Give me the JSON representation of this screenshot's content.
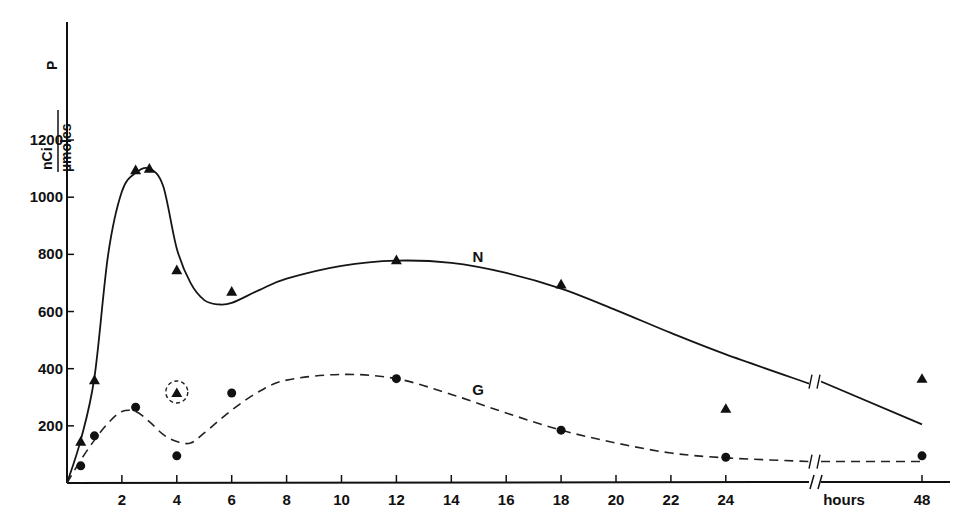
{
  "chart_data": {
    "type": "line",
    "title": "",
    "ylabel": {
      "numerator": "nCi",
      "denominator": "µmoles",
      "suffix": "P"
    },
    "xlabel": "hours",
    "ylim": [
      0,
      1200
    ],
    "xlim": [
      0,
      48
    ],
    "x_axis_break": {
      "between": [
        24,
        48
      ]
    },
    "yticks": [
      200,
      400,
      600,
      800,
      1000,
      1200
    ],
    "ytick_labels": [
      "200",
      "400",
      "600",
      "800",
      "1000",
      "1200"
    ],
    "xticks": [
      2,
      4,
      6,
      8,
      10,
      12,
      14,
      16,
      18,
      20,
      22,
      24,
      48
    ],
    "xtick_labels": [
      "2",
      "4",
      "6",
      "8",
      "10",
      "12",
      "14",
      "16",
      "18",
      "20",
      "22",
      "24",
      "48"
    ],
    "grid": false,
    "legend": "none (series labeled inline)",
    "series": [
      {
        "name": "N",
        "marker": "triangle",
        "line_style": "solid",
        "points": [
          {
            "x": 0.5,
            "y": 145
          },
          {
            "x": 1,
            "y": 360
          },
          {
            "x": 2.5,
            "y": 1095
          },
          {
            "x": 3,
            "y": 1100
          },
          {
            "x": 4,
            "y": 745
          },
          {
            "x": 6,
            "y": 670
          },
          {
            "x": 12,
            "y": 780
          },
          {
            "x": 18,
            "y": 695
          },
          {
            "x": 24,
            "y": 260
          },
          {
            "x": 48,
            "y": 365
          }
        ],
        "outliers_circled": [
          {
            "x": 4,
            "y": 315
          }
        ],
        "fitted_curve": [
          [
            0,
            0
          ],
          [
            0.5,
            150
          ],
          [
            1,
            370
          ],
          [
            1.5,
            800
          ],
          [
            2,
            1020
          ],
          [
            2.5,
            1085
          ],
          [
            3,
            1100
          ],
          [
            3.5,
            1040
          ],
          [
            4,
            820
          ],
          [
            4.5,
            700
          ],
          [
            5,
            640
          ],
          [
            5.5,
            625
          ],
          [
            6,
            630
          ],
          [
            7,
            675
          ],
          [
            8,
            715
          ],
          [
            10,
            760
          ],
          [
            12,
            778
          ],
          [
            14,
            770
          ],
          [
            16,
            735
          ],
          [
            18,
            680
          ],
          [
            20,
            605
          ],
          [
            22,
            525
          ],
          [
            24,
            450
          ],
          [
            26.5,
            355
          ],
          [
            48,
            205
          ]
        ]
      },
      {
        "name": "G",
        "marker": "circle",
        "line_style": "dashed",
        "points": [
          {
            "x": 0.5,
            "y": 60
          },
          {
            "x": 1,
            "y": 165
          },
          {
            "x": 2.5,
            "y": 265
          },
          {
            "x": 4,
            "y": 95
          },
          {
            "x": 6,
            "y": 315
          },
          {
            "x": 12,
            "y": 365
          },
          {
            "x": 18,
            "y": 185
          },
          {
            "x": 24,
            "y": 90
          },
          {
            "x": 48,
            "y": 95
          }
        ],
        "fitted_curve": [
          [
            0,
            0
          ],
          [
            0.5,
            80
          ],
          [
            1,
            150
          ],
          [
            1.5,
            210
          ],
          [
            2,
            250
          ],
          [
            2.5,
            250
          ],
          [
            3,
            215
          ],
          [
            3.5,
            170
          ],
          [
            4,
            145
          ],
          [
            4.5,
            140
          ],
          [
            5,
            175
          ],
          [
            6,
            255
          ],
          [
            7,
            320
          ],
          [
            8,
            360
          ],
          [
            10,
            380
          ],
          [
            12,
            365
          ],
          [
            14,
            310
          ],
          [
            16,
            245
          ],
          [
            18,
            185
          ],
          [
            20,
            140
          ],
          [
            22,
            105
          ],
          [
            24,
            88
          ],
          [
            26.5,
            75
          ],
          [
            48,
            75
          ]
        ]
      }
    ]
  }
}
